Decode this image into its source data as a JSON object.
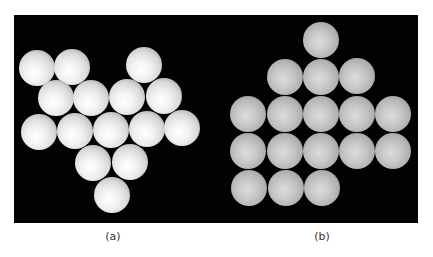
{
  "figure": {
    "background_color": "#020202",
    "panels": [
      {
        "label": "(a)",
        "description": "Irregular cluster of 15 white spheres on black background",
        "sphere_count": 15,
        "sphere_radius": 18,
        "spheres": [
          {
            "x": 37,
            "y": 68
          },
          {
            "x": 72,
            "y": 67
          },
          {
            "x": 144,
            "y": 65
          },
          {
            "x": 56,
            "y": 98
          },
          {
            "x": 91,
            "y": 98
          },
          {
            "x": 127,
            "y": 97
          },
          {
            "x": 164,
            "y": 96
          },
          {
            "x": 39,
            "y": 132
          },
          {
            "x": 75,
            "y": 131
          },
          {
            "x": 111,
            "y": 130
          },
          {
            "x": 147,
            "y": 129
          },
          {
            "x": 182,
            "y": 128
          },
          {
            "x": 93,
            "y": 163
          },
          {
            "x": 130,
            "y": 162
          },
          {
            "x": 112,
            "y": 195
          }
        ]
      },
      {
        "label": "(b)",
        "description": "Square-lattice arrangement of 17 gray spheres on black background",
        "sphere_count": 17,
        "sphere_radius": 18,
        "spheres": [
          {
            "x": 321,
            "y": 40
          },
          {
            "x": 285,
            "y": 77
          },
          {
            "x": 321,
            "y": 77
          },
          {
            "x": 357,
            "y": 76
          },
          {
            "x": 248,
            "y": 114
          },
          {
            "x": 285,
            "y": 114
          },
          {
            "x": 321,
            "y": 114
          },
          {
            "x": 357,
            "y": 114
          },
          {
            "x": 393,
            "y": 114
          },
          {
            "x": 248,
            "y": 151
          },
          {
            "x": 285,
            "y": 151
          },
          {
            "x": 321,
            "y": 151
          },
          {
            "x": 357,
            "y": 151
          },
          {
            "x": 393,
            "y": 151
          },
          {
            "x": 249,
            "y": 188
          },
          {
            "x": 286,
            "y": 188
          },
          {
            "x": 322,
            "y": 188
          }
        ]
      }
    ]
  }
}
